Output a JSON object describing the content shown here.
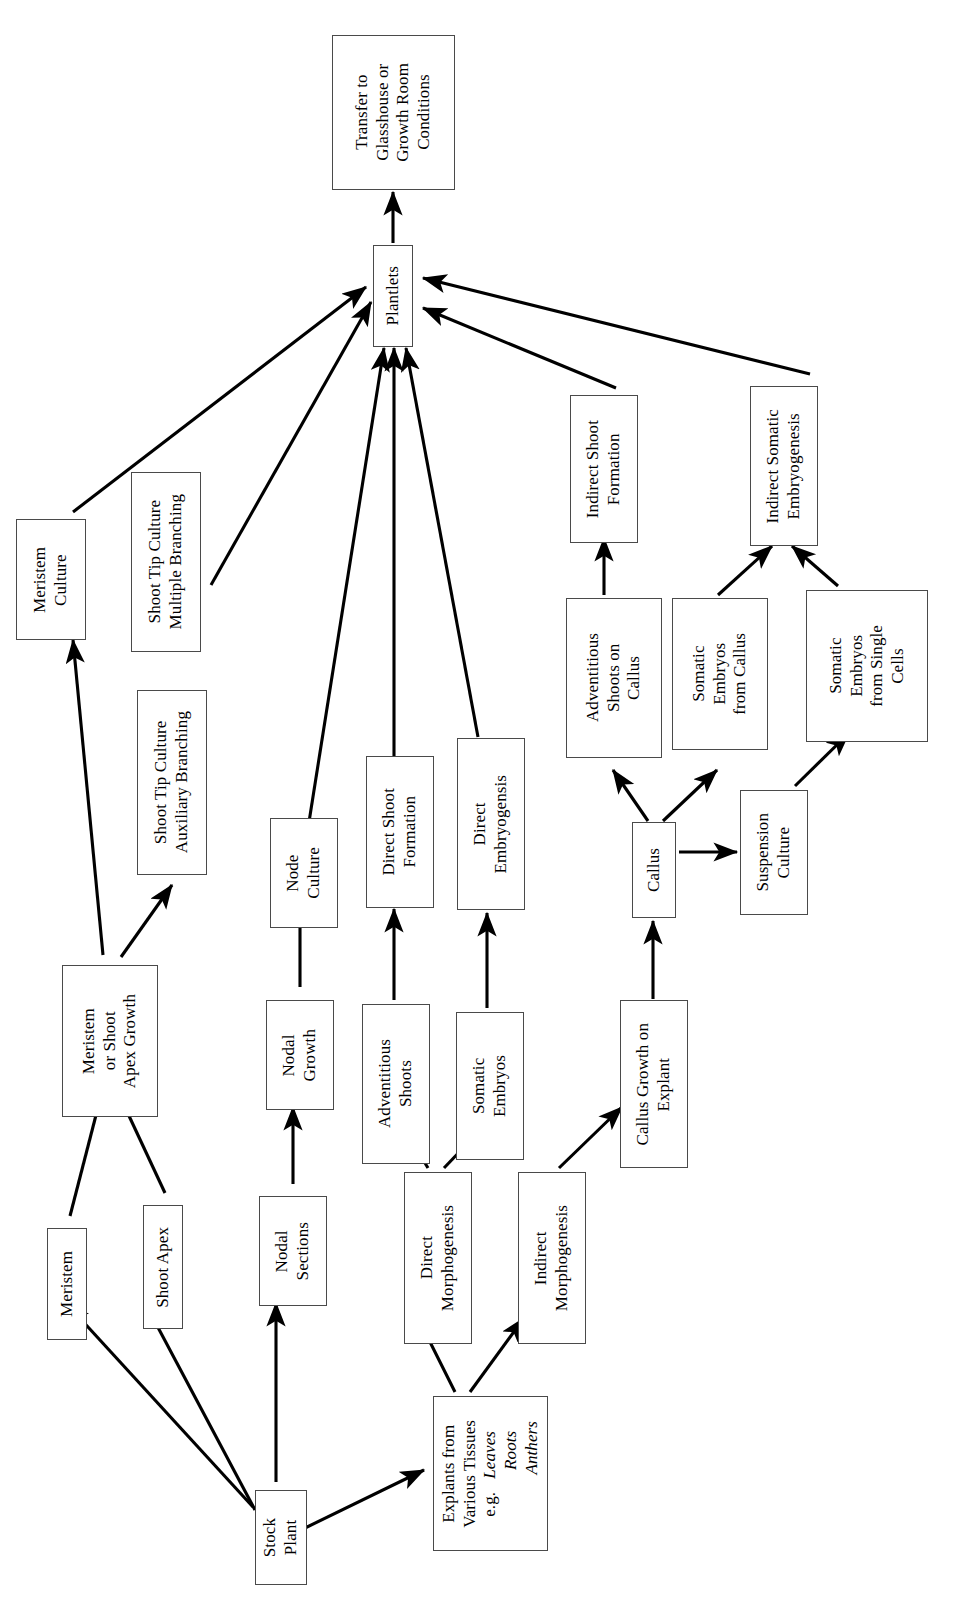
{
  "diagram": {
    "orientation": "rotated-90-ccw",
    "background_color": "#ffffff",
    "box_border_color": "#4a4a4a",
    "arrow_color": "#000000",
    "nodes": [
      {
        "id": "transfer",
        "label": "Transfer to\nGlasshouse or\nGrowth Room\nConditions"
      },
      {
        "id": "plantlets",
        "label": "Plantlets"
      },
      {
        "id": "meristem-culture",
        "label": "Meristem\nCulture"
      },
      {
        "id": "stc-multiple",
        "label": "Shoot Tip Culture\nMultiple Branching"
      },
      {
        "id": "stc-auxiliary",
        "label": "Shoot Tip Culture\nAuxiliary Branching"
      },
      {
        "id": "meristem-shoot-apex-growth",
        "label": "Meristem\nor Shoot\nApex Growth"
      },
      {
        "id": "meristem",
        "label": "Meristem"
      },
      {
        "id": "shoot-apex",
        "label": "Shoot Apex"
      },
      {
        "id": "node-culture",
        "label": "Node\nCulture"
      },
      {
        "id": "nodal-growth",
        "label": "Nodal\nGrowth"
      },
      {
        "id": "nodal-sections",
        "label": "Nodal\nSections"
      },
      {
        "id": "direct-shoot-formation",
        "label": "Direct Shoot\nFormation"
      },
      {
        "id": "adventitious-shoots",
        "label": "Adventitious\nShoots"
      },
      {
        "id": "direct-embryogensis",
        "label": "Direct\nEmbryogensis"
      },
      {
        "id": "somatic-embryos",
        "label": "Somatic\nEmbryos"
      },
      {
        "id": "direct-morphogenesis",
        "label": "Direct\nMorphogenesis"
      },
      {
        "id": "indirect-morphogenesis",
        "label": "Indirect\nMorphogenesis"
      },
      {
        "id": "indirect-shoot-formation",
        "label": "Indirect Shoot\nFormation"
      },
      {
        "id": "adventitious-shoots-on-callus",
        "label": "Adventitious\nShoots on\nCallus"
      },
      {
        "id": "somatic-embryos-from-callus",
        "label": "Somatic\nEmbryos\nfrom Callus"
      },
      {
        "id": "indirect-somatic-embryogenesis",
        "label": "Indirect Somatic\nEmbryogenesis"
      },
      {
        "id": "somatic-embryos-single-cells",
        "label": "Somatic\nEmbryos\nfrom Single\nCells"
      },
      {
        "id": "callus",
        "label": "Callus"
      },
      {
        "id": "suspension-culture",
        "label": "Suspension\nCulture"
      },
      {
        "id": "callus-growth-on-explant",
        "label": "Callus Growth on\nExplant"
      },
      {
        "id": "explants",
        "label": "Explants from\nVarious Tissues\ne.g.   Leaves\n           Roots\n            Anthers"
      },
      {
        "id": "stock-plant",
        "label": "Stock\nPlant"
      }
    ],
    "edges": [
      {
        "from": "plantlets",
        "to": "transfer"
      },
      {
        "from": "meristem-culture",
        "to": "plantlets"
      },
      {
        "from": "stc-multiple",
        "to": "plantlets"
      },
      {
        "from": "node-culture",
        "to": "plantlets"
      },
      {
        "from": "direct-shoot-formation",
        "to": "plantlets"
      },
      {
        "from": "direct-embryogensis",
        "to": "plantlets"
      },
      {
        "from": "indirect-shoot-formation",
        "to": "plantlets"
      },
      {
        "from": "indirect-somatic-embryogenesis",
        "to": "plantlets"
      },
      {
        "from": "meristem-shoot-apex-growth",
        "to": "meristem-culture"
      },
      {
        "from": "meristem-shoot-apex-growth",
        "to": "stc-auxiliary"
      },
      {
        "from": "stc-auxiliary",
        "to": "stc-multiple"
      },
      {
        "from": "meristem",
        "to": "meristem-shoot-apex-growth"
      },
      {
        "from": "shoot-apex",
        "to": "meristem-shoot-apex-growth"
      },
      {
        "from": "stock-plant",
        "to": "meristem"
      },
      {
        "from": "stock-plant",
        "to": "shoot-apex"
      },
      {
        "from": "stock-plant",
        "to": "nodal-sections"
      },
      {
        "from": "stock-plant",
        "to": "explants"
      },
      {
        "from": "nodal-sections",
        "to": "nodal-growth"
      },
      {
        "from": "nodal-growth",
        "to": "node-culture"
      },
      {
        "from": "explants",
        "to": "direct-morphogenesis"
      },
      {
        "from": "explants",
        "to": "indirect-morphogenesis"
      },
      {
        "from": "direct-morphogenesis",
        "to": "adventitious-shoots"
      },
      {
        "from": "direct-morphogenesis",
        "to": "somatic-embryos"
      },
      {
        "from": "adventitious-shoots",
        "to": "direct-shoot-formation"
      },
      {
        "from": "somatic-embryos",
        "to": "direct-embryogensis"
      },
      {
        "from": "indirect-morphogenesis",
        "to": "callus-growth-on-explant"
      },
      {
        "from": "callus-growth-on-explant",
        "to": "callus"
      },
      {
        "from": "callus",
        "to": "adventitious-shoots-on-callus"
      },
      {
        "from": "callus",
        "to": "somatic-embryos-from-callus"
      },
      {
        "from": "callus",
        "to": "suspension-culture"
      },
      {
        "from": "adventitious-shoots-on-callus",
        "to": "indirect-shoot-formation"
      },
      {
        "from": "somatic-embryos-from-callus",
        "to": "indirect-somatic-embryogenesis"
      },
      {
        "from": "suspension-culture",
        "to": "somatic-embryos-single-cells"
      },
      {
        "from": "somatic-embryos-single-cells",
        "to": "indirect-somatic-embryogenesis"
      }
    ]
  }
}
